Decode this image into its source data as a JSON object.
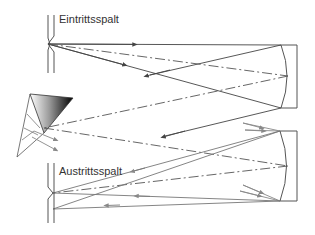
{
  "diagram": {
    "type": "Czerny-Turner spectrometer with prism (optical path schematic)",
    "labels": {
      "entrance_slit": "Eintrittsspalt",
      "exit_slit": "Austrittsspalt"
    },
    "components": [
      {
        "name": "entrance-slit",
        "label": "Eintrittsspalt"
      },
      {
        "name": "collimating-mirror",
        "position": "upper right"
      },
      {
        "name": "prism",
        "position": "left middle"
      },
      {
        "name": "focusing-mirror",
        "position": "lower right"
      },
      {
        "name": "exit-slit",
        "label": "Austrittsspalt"
      }
    ],
    "colors": {
      "line": "#555555",
      "ray_gray": "#777777",
      "text": "#333333",
      "background": "#ffffff"
    }
  }
}
